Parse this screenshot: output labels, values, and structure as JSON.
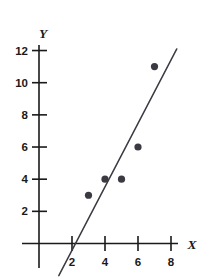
{
  "chart_data": {
    "type": "scatter",
    "title": "",
    "xlabel": "X",
    "ylabel": "Y",
    "xlim": [
      0,
      9.2
    ],
    "ylim": [
      -1.2,
      12.6
    ],
    "xticks": [
      2,
      4,
      6,
      8
    ],
    "yticks": [
      2,
      4,
      6,
      8,
      10,
      12
    ],
    "xtick_labels": [
      "2",
      "4",
      "6",
      "8"
    ],
    "ytick_labels": [
      "2",
      "4",
      "6",
      "8",
      "10",
      "12"
    ],
    "grid": false,
    "legend": null,
    "points": [
      {
        "x": 3,
        "y": 3
      },
      {
        "x": 4,
        "y": 4
      },
      {
        "x": 5,
        "y": 4
      },
      {
        "x": 6,
        "y": 6
      },
      {
        "x": 7,
        "y": 11
      }
    ],
    "series": [
      {
        "name": "observations",
        "x": [
          3,
          4,
          5,
          6,
          7
        ],
        "values": [
          3,
          4,
          4,
          6,
          11
        ]
      }
    ],
    "fit_line": {
      "name": "line of best fit",
      "x_start": 1.2,
      "y_start": -2.0,
      "x_end": 8.35,
      "y_end": 12.1,
      "x_intercept": 2,
      "slope": 2.0
    },
    "colors": {
      "point": "#3a3a42",
      "line": "#3a3a42",
      "axis": "#1a1a1a",
      "background": "#ffffff"
    }
  },
  "labels": {
    "y_axis_name": "Y",
    "x_axis_name": "X",
    "y_12": "12",
    "y_10": "10",
    "y_8": "8",
    "y_6": "6",
    "y_4": "4",
    "y_2": "2",
    "x_2": "2",
    "x_4": "4",
    "x_6": "6",
    "x_8": "8"
  }
}
